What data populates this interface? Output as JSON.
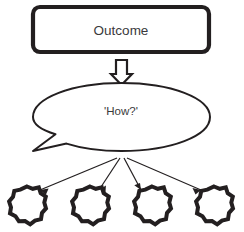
{
  "diagram": {
    "colors": {
      "stroke": "#231f20",
      "fill": "#ffffff",
      "text": "#3a3a3c",
      "background": "#ffffff"
    },
    "outcome_box": {
      "label": "Outcome",
      "shape": "rounded-rectangle"
    },
    "flow_arrow": {
      "icon_name": "down-block-arrow-icon",
      "direction": "down"
    },
    "speech_bubble": {
      "label": "'How?'",
      "shape": "ellipse-callout",
      "tail_direction": "lower-left"
    },
    "connectors": [
      {
        "label": "connector-to-method-1"
      },
      {
        "label": "connector-to-method-2"
      },
      {
        "label": "connector-to-method-3"
      },
      {
        "label": "connector-to-method-4"
      }
    ],
    "methods": [
      {
        "label": "",
        "shape": "gear",
        "teeth": 12
      },
      {
        "label": "",
        "shape": "gear",
        "teeth": 12
      },
      {
        "label": "",
        "shape": "gear",
        "teeth": 12
      },
      {
        "label": "",
        "shape": "gear",
        "teeth": 12
      }
    ]
  }
}
